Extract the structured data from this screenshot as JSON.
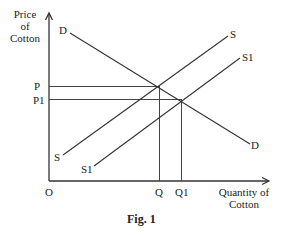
{
  "diagram": {
    "type": "supply_demand",
    "y_axis_label": [
      "Price",
      "of",
      "Cotton"
    ],
    "x_axis_label": [
      "Quantity of",
      "Cotton"
    ],
    "origin_label": "O",
    "caption": "Fig. 1",
    "curves": {
      "demand": {
        "label_start": "D",
        "label_end": "D"
      },
      "supply": {
        "label_start": "S",
        "label_end": "S"
      },
      "supply_shifted": {
        "label_start": "S1",
        "label_end": "S1"
      }
    },
    "price_labels": {
      "p": "P",
      "p1": "P1"
    },
    "quantity_labels": {
      "q": "Q",
      "q1": "Q1"
    },
    "colors": {
      "line": "#333333",
      "text": "#222222",
      "background": "#ffffff"
    }
  }
}
